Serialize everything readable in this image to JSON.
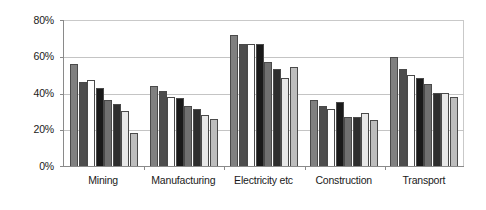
{
  "chart_data": {
    "type": "bar",
    "title": "",
    "subtitle": "",
    "xlabel": "",
    "ylabel": "",
    "ylim": [
      0,
      80
    ],
    "ytick_labels": [
      "80%",
      "60%",
      "40%",
      "20%",
      "0%"
    ],
    "ytick_values": [
      80,
      60,
      40,
      20,
      0
    ],
    "grid": true,
    "legend": "none",
    "categories": [
      "Mining",
      "Manufacturing",
      "Electricity etc",
      "Construction",
      "Transport"
    ],
    "series": [
      {
        "name": "Series 1",
        "fill": "#808080",
        "values": [
          56,
          44,
          72,
          36,
          60
        ]
      },
      {
        "name": "Series 2",
        "fill": "#4d4d4d",
        "values": [
          46,
          41,
          67,
          33,
          53
        ]
      },
      {
        "name": "Series 3",
        "fill": "#ffffff",
        "values": [
          47,
          38,
          67,
          31,
          50
        ]
      },
      {
        "name": "Series 4",
        "fill": "#1a1a1a",
        "values": [
          43,
          37,
          67,
          35,
          48
        ]
      },
      {
        "name": "Series 5",
        "fill": "#707070",
        "values": [
          36,
          33,
          57,
          27,
          45
        ]
      },
      {
        "name": "Series 6",
        "fill": "#2e2e2e",
        "values": [
          34,
          31,
          53,
          27,
          40
        ]
      },
      {
        "name": "Series 7",
        "fill": "#e8e8e8",
        "values": [
          30,
          28,
          48,
          29,
          40
        ]
      },
      {
        "name": "Series 8",
        "fill": "#bdbdbd",
        "values": [
          18,
          26,
          54,
          25,
          38
        ]
      }
    ]
  }
}
